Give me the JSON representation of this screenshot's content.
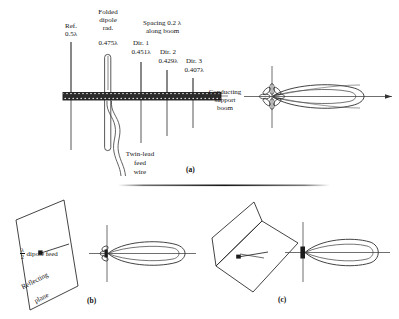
{
  "figure": {
    "title_alt": "Yagi-Uda array, plane reflector and corner reflector antennas",
    "background": "#ffffff",
    "ink": "#141414"
  },
  "panel_a": {
    "id": "(a)",
    "labels": {
      "reflector_name": "Ref.",
      "reflector_len": "0.5λ",
      "folded_dipole_l1": "Folded",
      "folded_dipole_l2": "dipole",
      "folded_dipole_l3": "rad.",
      "folded_dipole_len": "0.475λ",
      "spacing_l1": "Spacing 0.2 λ",
      "spacing_l2": "along boom",
      "dir1_name": "Dir. 1",
      "dir1_len": "0.451λ",
      "dir2_name": "Dir. 2",
      "dir2_len": "0.429λ",
      "dir3_name": "Dir. 3",
      "dir3_len": "0.407λ",
      "boom_l1": "Conducting",
      "boom_l2": "support",
      "boom_l3": "boom",
      "feed_l1": "Twin-lead",
      "feed_l2": "feed",
      "feed_l3": "wire"
    },
    "elements": [
      {
        "name": "Ref.",
        "length_lambda": 0.5
      },
      {
        "name": "Folded dipole rad.",
        "length_lambda": 0.475
      },
      {
        "name": "Dir. 1",
        "length_lambda": 0.451
      },
      {
        "name": "Dir. 2",
        "length_lambda": 0.429
      },
      {
        "name": "Dir. 3",
        "length_lambda": 0.407
      }
    ],
    "spacing_lambda": 0.2
  },
  "panel_b": {
    "id": "(b)",
    "labels": {
      "feed_num": "λ",
      "feed_den": "2",
      "feed_text": "dipole feed",
      "plane_l1": "Reflecting",
      "plane_l2": "plane"
    }
  },
  "panel_c": {
    "id": "(c)"
  }
}
